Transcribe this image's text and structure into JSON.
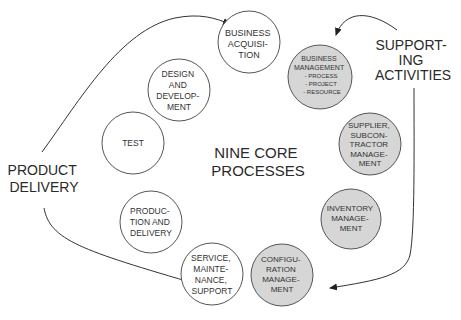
{
  "center_title": {
    "lines": [
      "NINE CORE",
      "PROCESSES"
    ]
  },
  "groups": {
    "product_delivery": {
      "lines": [
        "PRODUCT",
        "DELIVERY"
      ]
    },
    "supporting_activities": {
      "lines": [
        "SUPPORT-",
        "ING",
        "ACTIVITIES"
      ]
    }
  },
  "core_processes": [
    {
      "id": "business-acquisition",
      "lines": [
        "BUSINESS",
        "ACQUISI-",
        "TION"
      ]
    },
    {
      "id": "design-and-development",
      "lines": [
        "DESIGN",
        "AND",
        "DEVELOP-",
        "MENT"
      ]
    },
    {
      "id": "test",
      "lines": [
        "TEST"
      ]
    },
    {
      "id": "production-and-delivery",
      "lines": [
        "PRODUC-",
        "TION AND",
        "DELIVERY"
      ]
    },
    {
      "id": "service-maintenance-support",
      "lines": [
        "SERVICE,",
        "MAINTE-",
        "NANCE,",
        "SUPPORT"
      ]
    }
  ],
  "support_processes": [
    {
      "id": "business-management",
      "lines": [
        "BUSINESS",
        "MANAGEMENT",
        "- PROCESS",
        "- PROJECT",
        "- RESOURCE"
      ]
    },
    {
      "id": "supplier-subcontractor-management",
      "lines": [
        "SUPPLIER,",
        "SUBCON-",
        "TRACTOR",
        "MANAGE-",
        "MENT"
      ]
    },
    {
      "id": "inventory-management",
      "lines": [
        "INVENTORY",
        "MANAGE-",
        "MENT"
      ]
    },
    {
      "id": "configuration-management",
      "lines": [
        "CONFIGU-",
        "RATION",
        "MANAGE-",
        "MENT"
      ]
    }
  ],
  "colors": {
    "core_fill": "#ffffff",
    "support_fill": "#d6d6d6",
    "stroke": "#555555",
    "text": "#333333"
  }
}
